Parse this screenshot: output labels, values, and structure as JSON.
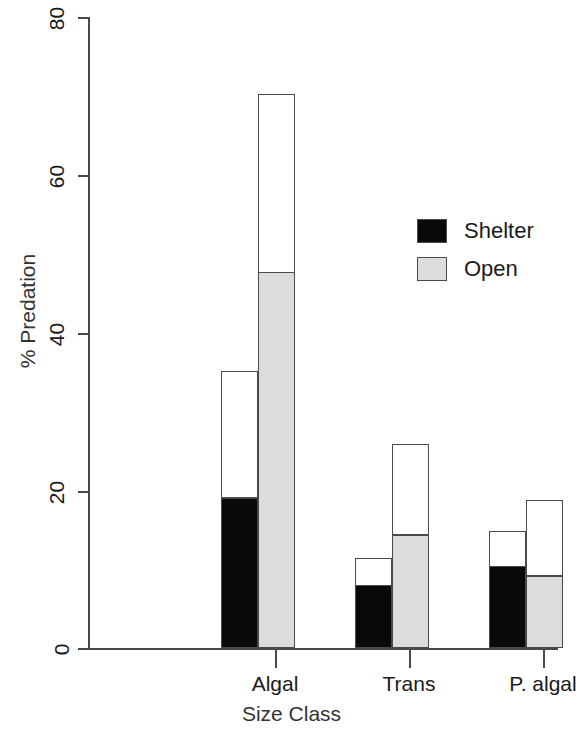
{
  "chart_data": {
    "type": "bar",
    "title": "",
    "xlabel": "Size Class",
    "ylabel": "% Predation",
    "categories": [
      "Algal",
      "Trans",
      "P. algal"
    ],
    "ylim": [
      0,
      80
    ],
    "yticks": [
      0,
      20,
      40,
      60,
      80
    ],
    "ytick_labels": [
      "0",
      "20",
      "40",
      "60",
      "80"
    ],
    "grid": false,
    "legend_position": "upper right",
    "stacked": true,
    "note": "Each bar is drawn with an outlined total height; the lower portion is filled (black = Shelter, light grey = Open) and the upper portion is left unfilled (white).",
    "series": [
      {
        "name": "Shelter",
        "color": "#0a0a0a",
        "filled_values": [
          18.8,
          7.7,
          10.1
        ],
        "total_values": [
          35.1,
          11.4,
          14.8
        ]
      },
      {
        "name": "Open",
        "color": "#dcdcdc",
        "filled_values": [
          47.4,
          14.1,
          8.9
        ],
        "total_values": [
          70.3,
          25.9,
          18.8
        ]
      }
    ]
  },
  "legend": {
    "items": [
      {
        "label": "Shelter",
        "swatch": "shelter"
      },
      {
        "label": "Open",
        "swatch": "open"
      }
    ]
  },
  "axes": {
    "y_title": "% Predation",
    "x_title": "Size Class",
    "y_labels": [
      "80",
      "60",
      "40",
      "20",
      "0"
    ],
    "x_labels": [
      "Algal",
      "Trans",
      "P. algal"
    ]
  }
}
